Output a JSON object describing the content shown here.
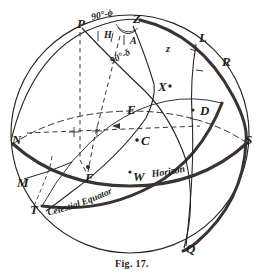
{
  "figure": {
    "caption": "Fig. 17."
  },
  "ink": {
    "line": "#2a2623",
    "thick": "#3a3330",
    "dash": "#3a3330",
    "background": "#ffffff"
  },
  "points": [
    {
      "id": "P",
      "label": "P",
      "x": 77,
      "y": 24,
      "size": "pt"
    },
    {
      "id": "Z",
      "label": "Z",
      "x": 133,
      "y": 19,
      "size": "pt"
    },
    {
      "id": "L",
      "label": "L",
      "x": 199,
      "y": 38,
      "size": "pt"
    },
    {
      "id": "R",
      "label": "R",
      "x": 222,
      "y": 62,
      "size": "pt"
    },
    {
      "id": "X",
      "label": "X",
      "x": 160,
      "y": 90,
      "size": "pt"
    },
    {
      "id": "D",
      "label": "D",
      "x": 200,
      "y": 113,
      "size": "pt"
    },
    {
      "id": "E",
      "label": "E",
      "x": 127,
      "y": 110,
      "size": "pt"
    },
    {
      "id": "N",
      "label": "N",
      "x": 12,
      "y": 140,
      "size": "pt"
    },
    {
      "id": "S",
      "label": "S",
      "x": 245,
      "y": 140,
      "size": "pt"
    },
    {
      "id": "C",
      "label": "C",
      "x": 143,
      "y": 142,
      "size": "pt"
    },
    {
      "id": "F",
      "label": "F",
      "x": 85,
      "y": 172,
      "size": "pt"
    },
    {
      "id": "W",
      "label": "W",
      "x": 133,
      "y": 171,
      "size": "pt"
    },
    {
      "id": "M",
      "label": "M",
      "x": 17,
      "y": 183,
      "size": "pt"
    },
    {
      "id": "T",
      "label": "T",
      "x": 30,
      "y": 210,
      "size": "pt"
    },
    {
      "id": "Q",
      "label": "Q",
      "x": 186,
      "y": 249,
      "size": "pt"
    },
    {
      "id": "H",
      "label": "H",
      "x": 104,
      "y": 37,
      "size": "sm"
    },
    {
      "id": "A",
      "label": "A",
      "x": 130,
      "y": 41,
      "size": "sm"
    },
    {
      "id": "z",
      "label": "z",
      "x": 166,
      "y": 50,
      "size": "sm"
    }
  ],
  "angle_labels": [
    {
      "id": "colatitude",
      "text": "90°-ϕ",
      "x": 92,
      "y": 14,
      "rotate": -12
    },
    {
      "id": "polar-distance",
      "text": "90°-δ",
      "x": 114,
      "y": 58,
      "rotate": -26
    }
  ],
  "curve_labels": [
    {
      "id": "celestial-equator",
      "text": "Celestial Equator"
    },
    {
      "id": "horizon",
      "text": "Horizon"
    }
  ],
  "center_dot": {
    "id": "center-dot-C",
    "x": 137,
    "y": 140
  }
}
